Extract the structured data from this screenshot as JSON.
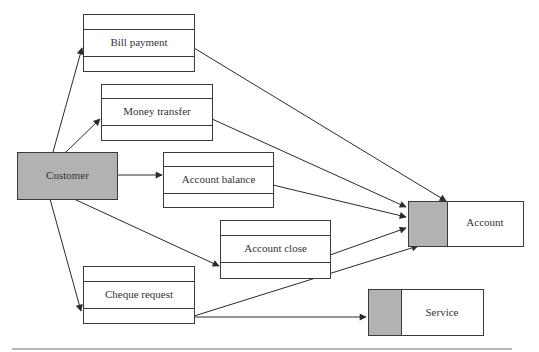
{
  "diagram": {
    "actor": {
      "label": "Customer",
      "fill": "#b2b2b2"
    },
    "operations": [
      {
        "id": "bill",
        "label": "Bill payment"
      },
      {
        "id": "money",
        "label": "Money transfer"
      },
      {
        "id": "balance",
        "label": "Account balance"
      },
      {
        "id": "close",
        "label": "Account close"
      },
      {
        "id": "cheque",
        "label": "Cheque request"
      }
    ],
    "entities": [
      {
        "id": "account",
        "label": "Account",
        "fill": "#b2b2b2"
      },
      {
        "id": "service",
        "label": "Service",
        "fill": "#b2b2b2"
      }
    ],
    "edges": [
      {
        "from": "Customer",
        "to": "Bill payment"
      },
      {
        "from": "Customer",
        "to": "Money transfer"
      },
      {
        "from": "Customer",
        "to": "Account balance"
      },
      {
        "from": "Customer",
        "to": "Account close"
      },
      {
        "from": "Customer",
        "to": "Cheque request"
      },
      {
        "from": "Bill payment",
        "to": "Account"
      },
      {
        "from": "Money transfer",
        "to": "Account"
      },
      {
        "from": "Account balance",
        "to": "Account"
      },
      {
        "from": "Account close",
        "to": "Account"
      },
      {
        "from": "Cheque request",
        "to": "Account"
      },
      {
        "from": "Cheque request",
        "to": "Service"
      }
    ],
    "colors": {
      "line": "#2a2a2a",
      "shade": "#b2b2b2",
      "rule": "#6e6e6e"
    }
  }
}
